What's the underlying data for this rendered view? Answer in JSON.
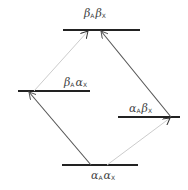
{
  "diagram": {
    "title": "",
    "colors": {
      "level": "#222222",
      "strong_transition": "#555555",
      "weak_transition": "#cccccc",
      "label": "#444444"
    },
    "levels": [
      {
        "id": "bb",
        "label_parts": [
          {
            "sym": "β",
            "sub": "A"
          },
          {
            "sym": "β",
            "sub": "X"
          }
        ],
        "x1": 63,
        "x2": 140,
        "y": 30,
        "label_x": 84,
        "label_y": 8
      },
      {
        "id": "ba",
        "label_parts": [
          {
            "sym": "β",
            "sub": "A"
          },
          {
            "sym": "α",
            "sub": "X"
          }
        ],
        "x1": 18,
        "x2": 90,
        "y": 91,
        "label_x": 64,
        "label_y": 77
      },
      {
        "id": "ab",
        "label_parts": [
          {
            "sym": "α",
            "sub": "A"
          },
          {
            "sym": "β",
            "sub": "X"
          }
        ],
        "x1": 118,
        "x2": 180,
        "y": 117,
        "label_x": 129,
        "label_y": 103
      },
      {
        "id": "aa",
        "label_parts": [
          {
            "sym": "α",
            "sub": "A"
          },
          {
            "sym": "α",
            "sub": "X"
          }
        ],
        "x1": 62,
        "x2": 138,
        "y": 165,
        "label_x": 91,
        "label_y": 170
      }
    ],
    "transitions": [
      {
        "from": "aa",
        "to": "ba",
        "x1": 91,
        "y1": 165,
        "x2": 29,
        "y2": 92,
        "style": "strong"
      },
      {
        "from": "aa",
        "to": "ab",
        "x1": 107,
        "y1": 165,
        "x2": 170,
        "y2": 118,
        "style": "weak"
      },
      {
        "from": "ba",
        "to": "bb",
        "x1": 34,
        "y1": 91,
        "x2": 88,
        "y2": 31,
        "style": "weak"
      },
      {
        "from": "ab",
        "to": "bb",
        "x1": 171,
        "y1": 117,
        "x2": 101,
        "y2": 31,
        "style": "strong"
      }
    ]
  }
}
